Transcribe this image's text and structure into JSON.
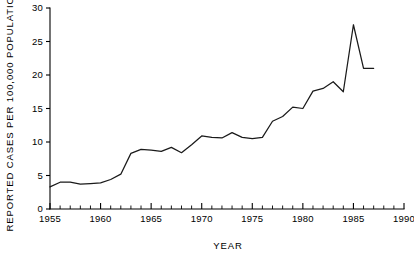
{
  "figure": {
    "background_color": "#ffffff",
    "line_color": "#1a1a1a",
    "axis_color": "#000000"
  },
  "chart_data": {
    "type": "line",
    "title": "",
    "subtitle": "",
    "xlabel": "YEAR",
    "ylabel": "REPORTED CASES PER 100,000 POPULATION",
    "xlim": [
      1955,
      1990
    ],
    "ylim": [
      0,
      30
    ],
    "grid": false,
    "legend": false,
    "legend_position": "none",
    "x_major_ticks": [
      1955,
      1960,
      1965,
      1970,
      1975,
      1980,
      1985,
      1990
    ],
    "x_major_tick_labels": [
      "1955",
      "1960",
      "1965",
      "1970",
      "1975",
      "1980",
      "1985",
      "1990"
    ],
    "x_minor_tick_interval": 1,
    "y_major_ticks": [
      0,
      5,
      10,
      15,
      20,
      25,
      30
    ],
    "y_major_tick_labels": [
      "0",
      "5",
      "10",
      "15",
      "20",
      "25",
      "30"
    ],
    "series": [
      {
        "name": "Reported cases per 100,000 population",
        "x": [
          1955,
          1956,
          1957,
          1958,
          1959,
          1960,
          1961,
          1962,
          1963,
          1964,
          1965,
          1966,
          1967,
          1968,
          1969,
          1970,
          1971,
          1972,
          1973,
          1974,
          1975,
          1976,
          1977,
          1978,
          1979,
          1980,
          1981,
          1982,
          1983,
          1984,
          1985,
          1986,
          1987
        ],
        "values": [
          3.3,
          4.0,
          4.0,
          3.7,
          3.8,
          3.9,
          4.4,
          5.2,
          8.3,
          8.9,
          8.8,
          8.6,
          9.2,
          8.4,
          9.6,
          10.9,
          10.7,
          10.6,
          11.4,
          10.7,
          10.5,
          10.7,
          13.1,
          13.8,
          15.2,
          15.0,
          17.6,
          18.0,
          19.0,
          17.5,
          27.5,
          21.0,
          21.0
        ],
        "annotations": [
          {
            "label": "peak",
            "x": 1985,
            "y": 27.5
          }
        ]
      }
    ]
  },
  "caption": {
    "partial_text": ""
  }
}
